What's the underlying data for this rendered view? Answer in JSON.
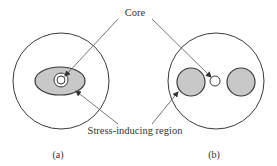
{
  "diagram": {
    "labels": {
      "core": "Core",
      "stress_region": "Stress-inducing region",
      "panel_a": "(a)",
      "panel_b": "(b)"
    },
    "colors": {
      "stroke": "#3a3a3a",
      "fill_stress": "#c8c8c8",
      "leader": "#555555",
      "background": "#ffffff"
    },
    "panels": [
      {
        "id": "a",
        "description": "Fiber cross-section with elliptical stress-inducing region around core"
      },
      {
        "id": "b",
        "description": "Fiber cross-section with two circular stress-inducing rods beside core"
      }
    ]
  }
}
